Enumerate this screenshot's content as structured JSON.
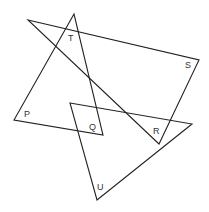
{
  "diagram": {
    "labels": {
      "T": "T",
      "S": "S",
      "P": "P",
      "Q": "Q",
      "R": "R",
      "U": "U"
    },
    "shapes": [
      {
        "name": "triangle-PTQ",
        "points": "74,14 14,120 103,135"
      },
      {
        "name": "triangle-TSR",
        "points": "28,20 199,60 159,144"
      },
      {
        "name": "triangle-QRU",
        "points": "70,103 192,124 97,200"
      }
    ],
    "stroke_color": "#222222"
  }
}
